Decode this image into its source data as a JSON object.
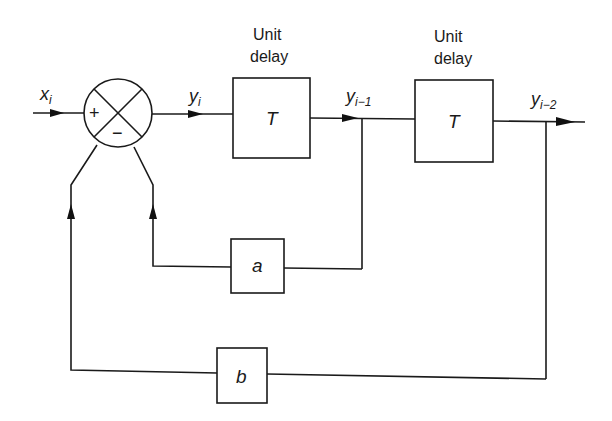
{
  "diagram": {
    "type": "block-diagram",
    "input": {
      "symbol": "x",
      "subscript": "i"
    },
    "summing_junction": {
      "plus_sign": "+",
      "minus_sign": "−"
    },
    "signals": {
      "y_i": {
        "symbol": "y",
        "subscript": "i"
      },
      "y_i_minus_1": {
        "symbol": "y",
        "subscript": "i−1"
      },
      "y_i_minus_2": {
        "symbol": "y",
        "subscript": "i−2"
      }
    },
    "delay_blocks": [
      {
        "title_line1": "Unit",
        "title_line2": "delay",
        "symbol": "T"
      },
      {
        "title_line1": "Unit",
        "title_line2": "delay",
        "symbol": "T"
      }
    ],
    "gain_blocks": {
      "a": {
        "symbol": "a"
      },
      "b": {
        "symbol": "b"
      }
    }
  }
}
